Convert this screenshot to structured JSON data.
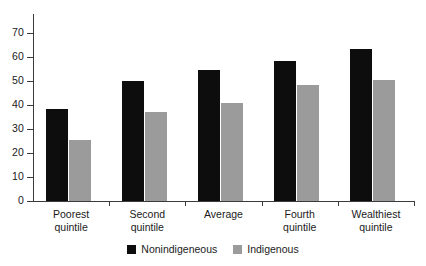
{
  "chart_data": {
    "type": "bar",
    "title": "",
    "subtitle": "",
    "xlabel": "",
    "ylabel": "",
    "categories": [
      "Poorest quintile",
      "Second quintile",
      "Average",
      "Fourth quintile",
      "Wealthiest quintile"
    ],
    "category_lines": [
      [
        "Poorest",
        "quintile"
      ],
      [
        "Second",
        "quintile"
      ],
      [
        "Average",
        ""
      ],
      [
        "Fourth",
        "quintile"
      ],
      [
        "Wealthiest",
        "quintile"
      ]
    ],
    "series": [
      {
        "name": "Nonindigeneous",
        "color": "#0d0d0d",
        "values": [
          38.5,
          50,
          54.5,
          58.5,
          63.5
        ]
      },
      {
        "name": "Indigenous",
        "color": "#9b9b9b",
        "values": [
          25.5,
          37,
          41,
          48.5,
          50.5
        ]
      }
    ],
    "ylim": [
      0,
      75
    ],
    "yticks": [
      0,
      10,
      20,
      30,
      40,
      50,
      60,
      70
    ],
    "ytick_labels": [
      "0",
      "10",
      "20",
      "30",
      "40",
      "50",
      "60",
      "70"
    ],
    "grid": false,
    "legend_position": "bottom-center"
  }
}
